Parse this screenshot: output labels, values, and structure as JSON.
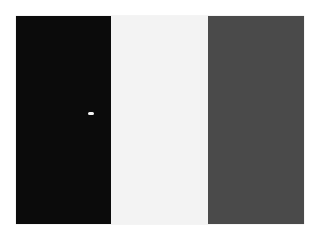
{
  "image": {
    "description": "Three vertical color bands: black, white, dark gray",
    "panels": [
      {
        "name": "left-band",
        "color": "#0b0b0b"
      },
      {
        "name": "middle-band",
        "color": "#f3f3f3"
      },
      {
        "name": "right-band",
        "color": "#4a4a4a"
      }
    ],
    "artifact": {
      "name": "small-white-speck",
      "color": "#f4f4f4"
    }
  }
}
